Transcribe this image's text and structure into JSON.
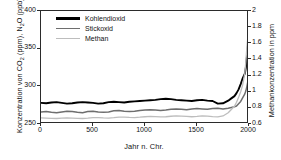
{
  "chart_data": {
    "type": "line",
    "title": "",
    "xlabel": "Jahr n. Chr.",
    "ylabel_left": "Konzentration von CO2 (ppm), N2O (ppb)",
    "ylabel_right": "Methankonzentration in ppm",
    "xlim": [
      0,
      2000
    ],
    "ylim_left": [
      250,
      400
    ],
    "ylim_right": [
      0.6,
      2.0
    ],
    "xticks": [
      0,
      500,
      1000,
      1500,
      2000
    ],
    "yticks_left": [
      250,
      300,
      350,
      400
    ],
    "yticks_right": [
      0.6,
      0.8,
      1.0,
      1.2,
      1.4,
      1.6,
      1.8,
      2.0
    ],
    "grid": false,
    "legend_position": "top-left",
    "series": [
      {
        "name": "Kohlendioxid",
        "axis": "left",
        "unit": "ppm",
        "color": "#000000",
        "width": 1.9,
        "x": [
          0,
          50,
          100,
          150,
          200,
          250,
          300,
          350,
          400,
          450,
          500,
          550,
          600,
          650,
          700,
          750,
          800,
          850,
          900,
          950,
          1000,
          1050,
          1100,
          1150,
          1200,
          1250,
          1300,
          1350,
          1400,
          1450,
          1500,
          1550,
          1600,
          1650,
          1700,
          1750,
          1800,
          1830,
          1860,
          1880,
          1900,
          1920,
          1940,
          1960,
          1970,
          1980,
          1990,
          2000
        ],
        "values": [
          278,
          277.5,
          278.5,
          279,
          278,
          277,
          277.5,
          278.5,
          279,
          278.5,
          278,
          277,
          277.5,
          279,
          279.5,
          279,
          278.5,
          279.5,
          280,
          280.5,
          281,
          281.5,
          282,
          283,
          283.5,
          283,
          282,
          281.5,
          281,
          280.5,
          281.5,
          282,
          281,
          280.5,
          277,
          277.5,
          281,
          284,
          287,
          291,
          296,
          303,
          311,
          317,
          325,
          339,
          354,
          369
        ]
      },
      {
        "name": "Stickoxid",
        "axis": "left",
        "unit": "ppb",
        "color": "#6e6e6e",
        "width": 1.5,
        "x": [
          0,
          50,
          100,
          150,
          200,
          250,
          300,
          350,
          400,
          450,
          500,
          550,
          600,
          650,
          700,
          750,
          800,
          850,
          900,
          950,
          1000,
          1050,
          1100,
          1150,
          1200,
          1250,
          1300,
          1350,
          1400,
          1450,
          1500,
          1550,
          1600,
          1650,
          1700,
          1750,
          1800,
          1830,
          1860,
          1880,
          1900,
          1920,
          1940,
          1960,
          1970,
          1980,
          1990,
          2000
        ],
        "values": [
          266,
          266.5,
          265.5,
          265,
          266,
          267,
          266.5,
          265.5,
          265,
          266.5,
          267,
          266,
          265.5,
          266,
          267.5,
          268,
          267,
          266.5,
          267,
          268,
          268.5,
          269,
          268.5,
          268,
          268.5,
          269.5,
          270,
          269.5,
          269,
          270,
          270.5,
          270,
          269.5,
          270.5,
          271,
          270,
          271,
          272,
          273,
          274,
          277,
          280,
          285,
          290,
          294,
          300,
          307,
          314
        ]
      },
      {
        "name": "Methan",
        "axis": "right",
        "unit": "ppm",
        "color": "#bdbdbd",
        "width": 1.3,
        "x": [
          0,
          50,
          100,
          150,
          200,
          250,
          300,
          350,
          400,
          450,
          500,
          550,
          600,
          650,
          700,
          750,
          800,
          850,
          900,
          950,
          1000,
          1050,
          1100,
          1150,
          1200,
          1250,
          1300,
          1350,
          1400,
          1450,
          1500,
          1550,
          1600,
          1650,
          1700,
          1750,
          1800,
          1830,
          1860,
          1880,
          1900,
          1920,
          1940,
          1960,
          1970,
          1980,
          1990,
          2000
        ],
        "values": [
          0.675,
          0.672,
          0.67,
          0.668,
          0.672,
          0.676,
          0.674,
          0.67,
          0.668,
          0.672,
          0.678,
          0.68,
          0.676,
          0.674,
          0.678,
          0.684,
          0.686,
          0.682,
          0.68,
          0.684,
          0.69,
          0.694,
          0.692,
          0.688,
          0.69,
          0.696,
          0.7,
          0.698,
          0.694,
          0.69,
          0.694,
          0.7,
          0.698,
          0.692,
          0.688,
          0.7,
          0.74,
          0.78,
          0.82,
          0.87,
          0.93,
          1.0,
          1.09,
          1.23,
          1.38,
          1.56,
          1.69,
          1.76
        ]
      }
    ]
  },
  "axes": {
    "x_title": "Jahr n. Chr.",
    "x_ticks": [
      "0",
      "500",
      "1000",
      "1500",
      "2000"
    ],
    "y_left_ticks": [
      "250",
      "300",
      "350",
      "400"
    ],
    "y_right_ticks": [
      "0.6",
      "0.8",
      "1",
      "1.2",
      "1.4",
      "1.6",
      "1.8",
      "2"
    ],
    "y_left_title_pre": "Konzentration von CO",
    "y_left_title_sub1": "2",
    "y_left_title_mid": " (ppm), N",
    "y_left_title_sub2": "2",
    "y_left_title_post": "O (ppb)",
    "y_right_title": "Methankonzentration in ppm"
  },
  "legend": {
    "items": [
      {
        "label": "Kohlendioxid",
        "color": "#000000"
      },
      {
        "label": "Stickoxid",
        "color": "#6e6e6e"
      },
      {
        "label": "Methan",
        "color": "#bdbdbd"
      }
    ]
  }
}
